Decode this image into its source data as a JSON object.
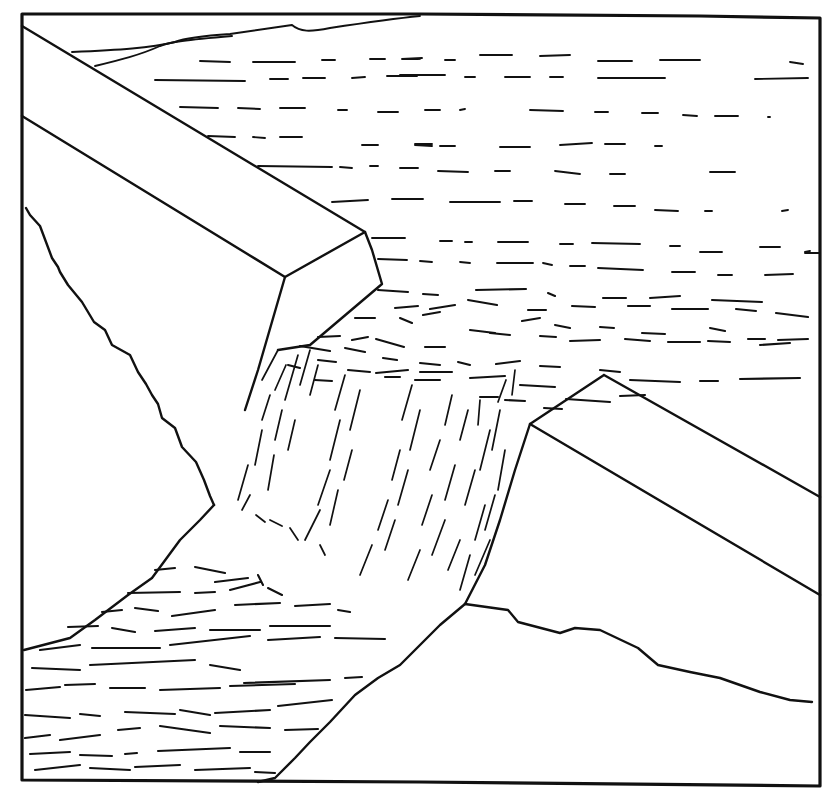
{
  "illustration": {
    "subject": "Dam breach with water flowing through a gap",
    "style": "black ink line drawing",
    "colors": {
      "ink": "#111111",
      "paper": "#ffffff"
    },
    "elements": [
      {
        "name": "reservoir",
        "description": "Still water behind the dam drawn with horizontal dashes"
      },
      {
        "name": "left-dam-segment",
        "description": "Left concrete dam block with angled top face"
      },
      {
        "name": "right-dam-segment",
        "description": "Right concrete dam block with angled top face"
      },
      {
        "name": "breach",
        "description": "Gap between the dam segments"
      },
      {
        "name": "waterfall",
        "description": "Water cascading through the breach drawn with vertical dashes"
      },
      {
        "name": "downstream-river",
        "description": "Wavy water flowing away in the lower left"
      },
      {
        "name": "far-shoreline",
        "description": "Distant bank at top of reservoir"
      }
    ]
  }
}
